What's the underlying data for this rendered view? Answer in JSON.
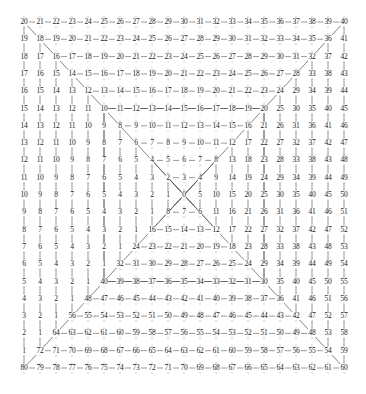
{
  "figure": {
    "title": "",
    "type": "numbered-square-ring-grid",
    "grid": {
      "rows": 21,
      "cols": 21,
      "center_index": 10,
      "origin_x": 24,
      "origin_y": 22,
      "step_x": 16.0,
      "step_y": 17.3
    },
    "colors": {
      "line": "#555555",
      "diagonal": "#555555",
      "text": "#1a1a1a",
      "background": "#ffffff"
    },
    "values": [
      [
        20,
        21,
        22,
        23,
        24,
        25,
        26,
        27,
        28,
        29,
        30,
        31,
        32,
        33,
        34,
        35,
        36,
        37,
        38,
        39,
        40
      ],
      [
        19,
        18,
        19,
        20,
        21,
        22,
        23,
        24,
        25,
        26,
        27,
        28,
        29,
        30,
        31,
        32,
        33,
        34,
        35,
        36,
        41
      ],
      [
        18,
        17,
        16,
        17,
        18,
        19,
        20,
        21,
        22,
        23,
        24,
        25,
        26,
        27,
        28,
        29,
        30,
        31,
        32,
        37,
        42
      ],
      [
        17,
        16,
        15,
        14,
        15,
        16,
        17,
        18,
        19,
        20,
        21,
        22,
        23,
        24,
        25,
        26,
        27,
        28,
        33,
        38,
        43
      ],
      [
        16,
        15,
        14,
        13,
        12,
        13,
        14,
        15,
        16,
        17,
        18,
        19,
        20,
        21,
        22,
        23,
        24,
        29,
        34,
        39,
        44
      ],
      [
        15,
        14,
        13,
        12,
        11,
        10,
        11,
        12,
        13,
        14,
        15,
        16,
        17,
        18,
        19,
        20,
        25,
        30,
        35,
        40,
        45
      ],
      [
        14,
        13,
        12,
        11,
        10,
        9,
        8,
        9,
        10,
        11,
        12,
        13,
        14,
        15,
        16,
        21,
        26,
        31,
        36,
        41,
        46
      ],
      [
        13,
        12,
        11,
        10,
        9,
        8,
        7,
        6,
        7,
        8,
        9,
        10,
        11,
        12,
        17,
        22,
        27,
        32,
        37,
        42,
        47
      ],
      [
        12,
        11,
        10,
        9,
        8,
        7,
        6,
        5,
        4,
        5,
        6,
        7,
        8,
        13,
        18,
        23,
        28,
        33,
        38,
        43,
        48
      ],
      [
        11,
        10,
        9,
        8,
        7,
        6,
        5,
        4,
        3,
        2,
        3,
        4,
        9,
        14,
        19,
        24,
        29,
        34,
        39,
        44,
        49
      ],
      [
        10,
        9,
        8,
        7,
        6,
        5,
        4,
        3,
        2,
        1,
        0,
        5,
        10,
        15,
        20,
        25,
        30,
        35,
        40,
        45,
        50
      ],
      [
        9,
        8,
        7,
        6,
        5,
        4,
        3,
        2,
        1,
        8,
        7,
        6,
        11,
        16,
        21,
        26,
        31,
        36,
        41,
        46,
        51
      ],
      [
        8,
        7,
        6,
        5,
        4,
        3,
        2,
        1,
        16,
        15,
        14,
        13,
        12,
        17,
        22,
        27,
        32,
        37,
        42,
        47,
        52
      ],
      [
        7,
        6,
        5,
        4,
        3,
        2,
        1,
        24,
        23,
        22,
        21,
        20,
        19,
        18,
        23,
        28,
        33,
        38,
        43,
        48,
        53
      ],
      [
        6,
        5,
        4,
        3,
        2,
        1,
        32,
        31,
        30,
        29,
        28,
        27,
        26,
        25,
        24,
        29,
        34,
        39,
        44,
        49,
        54
      ],
      [
        5,
        4,
        3,
        2,
        1,
        40,
        39,
        38,
        37,
        36,
        35,
        34,
        33,
        32,
        31,
        30,
        35,
        40,
        45,
        50,
        55
      ],
      [
        4,
        3,
        2,
        1,
        48,
        47,
        46,
        45,
        44,
        43,
        42,
        41,
        40,
        39,
        38,
        37,
        36,
        41,
        46,
        51,
        56
      ],
      [
        3,
        2,
        1,
        56,
        55,
        54,
        53,
        52,
        51,
        50,
        49,
        48,
        47,
        46,
        45,
        44,
        43,
        42,
        47,
        52,
        57
      ],
      [
        2,
        1,
        64,
        63,
        62,
        61,
        60,
        59,
        58,
        57,
        56,
        55,
        54,
        53,
        52,
        51,
        50,
        49,
        48,
        53,
        58
      ],
      [
        1,
        72,
        71,
        70,
        69,
        68,
        67,
        66,
        65,
        64,
        63,
        62,
        61,
        60,
        59,
        58,
        57,
        56,
        55,
        54,
        59
      ],
      [
        80,
        79,
        78,
        77,
        76,
        75,
        74,
        73,
        72,
        71,
        70,
        69,
        68,
        67,
        66,
        65,
        64,
        63,
        62,
        61,
        60
      ]
    ]
  }
}
